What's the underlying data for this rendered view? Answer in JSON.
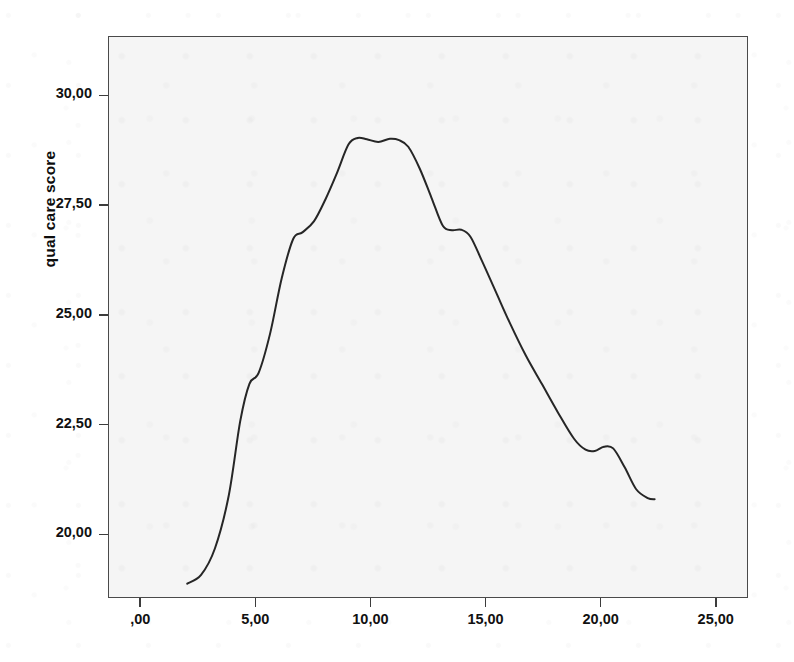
{
  "figure": {
    "background_color": "#ffffff",
    "plot_background_color": "#f5f5f5",
    "frame_color": "#4a4a4a",
    "line_color": "#262626"
  },
  "axes": {
    "y_title": "qual care score",
    "y_ticks": [
      "20,00",
      "22,50",
      "25,00",
      "27,50",
      "30,00"
    ],
    "x_ticks": [
      ",00",
      "5,00",
      "10,00",
      "15,00",
      "20,00",
      "25,00"
    ]
  },
  "bleed_text": [
    {
      "text": "the second",
      "x": 555,
      "y": 34
    },
    {
      "text": "in care",
      "x": 560,
      "y": 58
    },
    {
      "text": "remove mark",
      "x": 540,
      "y": 82
    },
    {
      "text": "a degree of hospital",
      "x": 418,
      "y": 150
    },
    {
      "text": "any conclusions can on quality of the problem",
      "x": 232,
      "y": 180
    },
    {
      "text": "the quality based care on a special of",
      "x": 238,
      "y": 210
    },
    {
      "text": "as some of quality of care studied that of",
      "x": 225,
      "y": 258
    },
    {
      "text": "a work of approach the hospital the it quality scale",
      "x": 200,
      "y": 305
    },
    {
      "text": "data, these values Wagner, to a district of all of",
      "x": 190,
      "y": 335
    },
    {
      "text": "proved that the shows of care quality of type",
      "x": 206,
      "y": 362
    },
    {
      "text": "the Cover, Bingh, L.  Magnitude Hospital",
      "x": 210,
      "y": 455
    },
    {
      "text": "care the quality care the Indiana.  Card.  17",
      "x": 244,
      "y": 480
    },
    {
      "text": "quality of the the quality on mass of medical facility",
      "x": 196,
      "y": 528
    },
    {
      "text": "the hospital and Quality scale for the nature all quality",
      "x": 183,
      "y": 552
    }
  ],
  "chart_data": {
    "type": "line",
    "title": "",
    "xlabel": "",
    "ylabel": "qual care score",
    "xlim": [
      -1.4,
      26.4
    ],
    "ylim": [
      18.55,
      31.35
    ],
    "grid": false,
    "legend": false,
    "smooth": true,
    "x": [
      2.0,
      2.6,
      3.2,
      3.8,
      4.3,
      4.7,
      5.1,
      5.6,
      6.1,
      6.6,
      7.0,
      7.5,
      8.0,
      8.5,
      9.0,
      9.4,
      9.8,
      10.3,
      10.8,
      11.2,
      11.6,
      12.1,
      12.6,
      13.1,
      13.5,
      13.9,
      14.3,
      14.8,
      15.4,
      16.0,
      16.7,
      17.4,
      18.1,
      18.8,
      19.3,
      19.7,
      20.1,
      20.5,
      21.0,
      21.5,
      22.0,
      22.3
    ],
    "y": [
      18.9,
      19.1,
      19.7,
      20.9,
      22.6,
      23.45,
      23.7,
      24.6,
      25.85,
      26.75,
      26.9,
      27.15,
      27.65,
      28.25,
      28.9,
      29.05,
      29.02,
      28.96,
      29.03,
      29.0,
      28.85,
      28.35,
      27.7,
      27.05,
      26.95,
      26.96,
      26.8,
      26.25,
      25.55,
      24.85,
      24.1,
      23.45,
      22.8,
      22.2,
      21.95,
      21.92,
      22.02,
      21.98,
      21.55,
      21.05,
      20.85,
      20.82
    ]
  }
}
